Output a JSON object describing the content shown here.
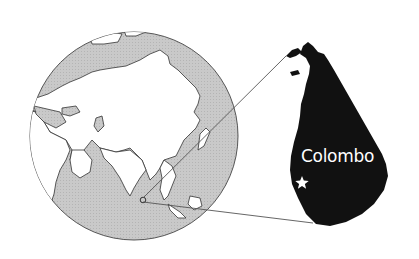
{
  "map": {
    "title": "",
    "inset_city_label": "Colombo",
    "marker_icon": "star-icon",
    "globe_region": "Eurasia and Africa viewed from space",
    "inset_region": "Sri Lanka",
    "colors": {
      "ocean": "#c8c8c8",
      "land": "#ffffff",
      "inset_land": "#111111",
      "leader_lines": "#555555",
      "marker": "#ffffff"
    }
  }
}
